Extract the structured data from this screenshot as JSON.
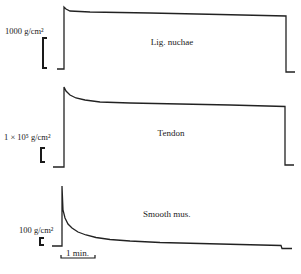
{
  "chart_data": {
    "type": "line",
    "title": "",
    "xlabel": "",
    "ylabel": "",
    "time_scale_bar": {
      "label": "1 min.",
      "x_start_px": 61,
      "x_end_px": 95,
      "y_px": 258
    },
    "grid": false,
    "legend": "none",
    "series": [
      {
        "name": "Lig. nuchae",
        "label": "Lig. nuchae",
        "scale_label": "1000 g/cm²",
        "scale_value": 1000,
        "scale_unit": "g/cm²",
        "scale_bar_px": {
          "x": 44,
          "y_top": 38,
          "y_bottom": 68
        },
        "label_pos_px": {
          "x": 172,
          "y": 45
        },
        "baseline_y_px": 69,
        "path_px": [
          [
            57,
            69
          ],
          [
            64,
            69
          ],
          [
            64,
            7
          ],
          [
            66,
            9
          ],
          [
            70,
            11
          ],
          [
            90,
            12
          ],
          [
            150,
            13
          ],
          [
            220,
            14.5
          ],
          [
            286,
            16
          ],
          [
            286,
            72
          ],
          [
            295,
            72
          ]
        ]
      },
      {
        "name": "Tendon",
        "label": "Tendon",
        "scale_label": "1 × 10⁵ g/cm²",
        "scale_value": 100000,
        "scale_unit": "g/cm²",
        "scale_bar_px": {
          "x": 41,
          "y_top": 148,
          "y_bottom": 162
        },
        "label_pos_px": {
          "x": 171,
          "y": 136
        },
        "baseline_y_px": 167,
        "path_px": [
          [
            53,
            167
          ],
          [
            64,
            167
          ],
          [
            64,
            87
          ],
          [
            66,
            91
          ],
          [
            70,
            95
          ],
          [
            76,
            98
          ],
          [
            85,
            100
          ],
          [
            100,
            102
          ],
          [
            130,
            103
          ],
          [
            180,
            104
          ],
          [
            230,
            105
          ],
          [
            285,
            106.5
          ],
          [
            285,
            165
          ],
          [
            294,
            165
          ]
        ]
      },
      {
        "name": "Smooth mus.",
        "label": "Smooth mus.",
        "scale_label": "100 g/cm²",
        "scale_value": 100,
        "scale_unit": "g/cm²",
        "scale_bar_px": {
          "x": 40,
          "y_top": 238,
          "y_bottom": 245
        },
        "label_pos_px": {
          "x": 143,
          "y": 217
        },
        "baseline_y_px": 246,
        "path_px": [
          [
            52,
            246
          ],
          [
            62,
            246
          ],
          [
            62,
            186
          ],
          [
            63,
            210
          ],
          [
            65,
            218
          ],
          [
            68,
            224
          ],
          [
            72,
            228
          ],
          [
            78,
            232
          ],
          [
            86,
            235
          ],
          [
            96,
            237.5
          ],
          [
            110,
            239.5
          ],
          [
            130,
            241
          ],
          [
            160,
            242.5
          ],
          [
            200,
            243.5
          ],
          [
            240,
            244.5
          ],
          [
            281,
            245.5
          ],
          [
            282,
            248.5
          ],
          [
            292,
            248.5
          ]
        ]
      }
    ]
  }
}
